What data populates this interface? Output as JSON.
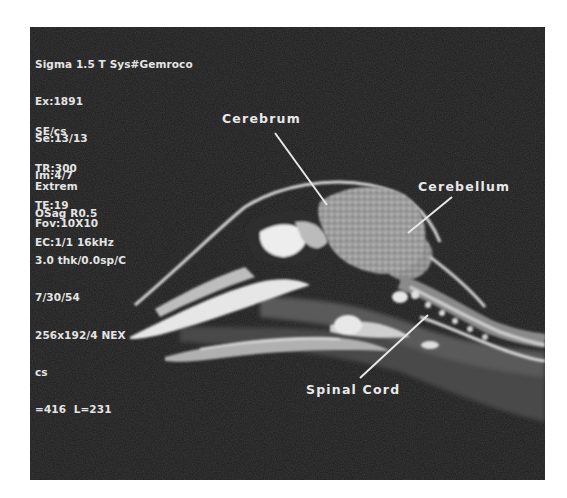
{
  "scan_info": {
    "block1": [
      "Sigma 1.5 T Sys#Gemroco",
      "Ex:1891",
      "Se:13/13",
      "Im:4/7",
      "OSag R0.5"
    ],
    "block2": [
      "SE/cs",
      "TR:300",
      "TE:19",
      "EC:1/1 16kHz"
    ],
    "block3": [
      "Extrem",
      "Fov:10X10",
      "3.0 thk/0.0sp/C",
      "7/30/54",
      "256x192/4 NEX",
      "cs",
      "=416  L=231"
    ]
  },
  "annotations": {
    "cerebrum": "Cerebrum",
    "cerebellum": "Cerebellum",
    "spinal_cord": "Spinal Cord"
  },
  "colors": {
    "background": "#1c1c1c",
    "text": "#e4e4e4",
    "page": "#ffffff"
  }
}
